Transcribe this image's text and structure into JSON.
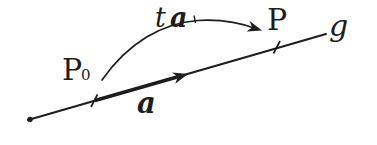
{
  "figure": {
    "labels": {
      "point_p0": "P",
      "point_p0_subscript": "0",
      "point_p": "P",
      "line_g": "g",
      "vector_a": "a",
      "scaled_vector_coefficient": "t",
      "scaled_vector_symbol": "a"
    },
    "colors": {
      "ink": "#1d1d1d",
      "background": "#ffffff"
    }
  }
}
